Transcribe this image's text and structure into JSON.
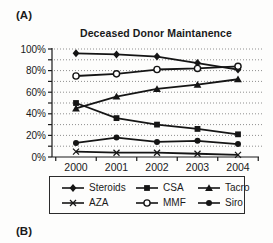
{
  "panel_labels": {
    "a": "(A)",
    "b": "(B)"
  },
  "chart_data": {
    "type": "line",
    "title": "Deceased Donor Maintanence",
    "categories": [
      "2000",
      "2001",
      "2002",
      "2003",
      "2004"
    ],
    "y_tick_labels": [
      "0%",
      "20%",
      "40%",
      "60%",
      "80%",
      "100%"
    ],
    "ylim": [
      0,
      100
    ],
    "y_major_step": 20,
    "y_minor_step": 10,
    "grid": "dotted horizontal every 10%",
    "legend_position": "bottom boxed, 2 rows x 3 columns",
    "line_color": "#151515",
    "grid_color": "#8f8f8f",
    "series": [
      {
        "name": "Steroids",
        "marker": "diamond",
        "values": [
          96,
          95,
          93,
          87,
          81
        ]
      },
      {
        "name": "CSA",
        "marker": "square",
        "values": [
          50,
          36,
          30,
          26,
          21
        ]
      },
      {
        "name": "Tacro",
        "marker": "triangle",
        "values": [
          45,
          56,
          63,
          67,
          72
        ]
      },
      {
        "name": "AZA",
        "marker": "x",
        "values": [
          5,
          4,
          4,
          3,
          2
        ]
      },
      {
        "name": "MMF",
        "marker": "circle-open",
        "values": [
          75,
          77,
          81,
          82,
          84
        ]
      },
      {
        "name": "Siro",
        "marker": "circle-filled",
        "values": [
          13,
          18,
          14,
          15,
          12
        ]
      }
    ]
  }
}
